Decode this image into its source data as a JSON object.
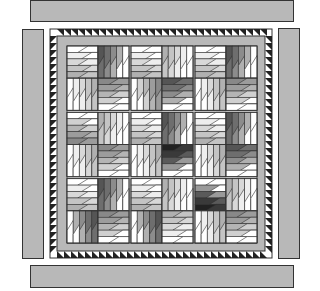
{
  "colors": {
    "background": "#ffffff",
    "strip_gray": "#b8b8b8",
    "outline": "#333333",
    "sashing": "#c8c8c8",
    "sawtooth_dark": "#222222",
    "sawtooth_light": "#ffffff"
  },
  "border_strips": {
    "top": {
      "x": 30,
      "y": 0,
      "w": 264,
      "h": 22
    },
    "bottom": {
      "x": 30,
      "y": 265,
      "w": 264,
      "h": 23
    },
    "left": {
      "x": 22,
      "y": 29,
      "w": 22,
      "h": 230
    },
    "right": {
      "x": 278,
      "y": 28,
      "w": 22,
      "h": 231
    }
  },
  "quilt": {
    "x": 50,
    "y": 29,
    "w": 222,
    "h": 229,
    "sawtooth_width": 7,
    "inner_border_width": 9,
    "block_area": {
      "x": 67,
      "y": 46,
      "w": 190,
      "h": 197
    },
    "grid": {
      "rows": 3,
      "cols": 3,
      "sashing": 2
    }
  },
  "tones": {
    "L": [
      "#ffffff",
      "#eeeeee",
      "#d8d8d8",
      "#c4c4c4",
      "#b0b0b0"
    ],
    "M": [
      "#ffffff",
      "#d0d0d0",
      "#b4b4b4",
      "#9c9c9c",
      "#888888"
    ],
    "D": [
      "#ffffff",
      "#b0b0b0",
      "#8c8c8c",
      "#6e6e6e",
      "#555555"
    ],
    "K": [
      "#ffffff",
      "#9a9a9a",
      "#5a5a5a",
      "#3a3a3a",
      "#222222"
    ]
  },
  "blocks": [
    [
      {
        "tl": "L",
        "tr": "D",
        "bl": "L",
        "br": "M"
      },
      {
        "tl": "L",
        "tr": "L",
        "bl": "M",
        "br": "D"
      },
      {
        "tl": "L",
        "tr": "D",
        "bl": "L",
        "br": "M"
      }
    ],
    [
      {
        "tl": "M",
        "tr": "L",
        "bl": "L",
        "br": "M"
      },
      {
        "tl": "L",
        "tr": "D",
        "bl": "L",
        "br": "K"
      },
      {
        "tl": "L",
        "tr": "D",
        "bl": "L",
        "br": "D"
      }
    ],
    [
      {
        "tl": "L",
        "tr": "D",
        "bl": "D",
        "br": "M"
      },
      {
        "tl": "L",
        "tr": "L",
        "bl": "D",
        "br": "L"
      },
      {
        "tl": "K",
        "tr": "L",
        "bl": "L",
        "br": "M"
      }
    ]
  ]
}
